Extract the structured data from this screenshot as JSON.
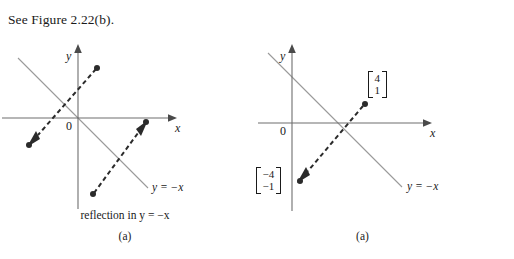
{
  "page": {
    "intro_text": "See Figure 2.22(b)."
  },
  "figures": [
    {
      "id": "figure-a-left",
      "caption_line1": "reflection in y = −x",
      "caption_line2": "(a)",
      "axes": {
        "x_label": "x",
        "y_label": "y",
        "origin_label": "0",
        "axis_color": "#6e6e6e"
      },
      "mirror_line": {
        "label": "y = −x",
        "color": "#9a9a9a",
        "equation": "y = -x"
      },
      "vectors": [
        {
          "name": "original-vector-arrow",
          "from": {
            "x": 98,
            "y": 68
          },
          "to": {
            "x": 30,
            "y": 145
          },
          "style": "dashed",
          "color": "#2b2b2b",
          "label": ""
        },
        {
          "name": "reflected-vector-arrow",
          "from": {
            "x": 92,
            "y": 193
          },
          "to": {
            "x": 145,
            "y": 122
          },
          "style": "dashed",
          "color": "#2b2b2b",
          "label": ""
        }
      ]
    },
    {
      "id": "figure-a-right",
      "caption_line1": "",
      "caption_line2": "(a)",
      "axes": {
        "x_label": "x",
        "y_label": "y",
        "origin_label": "0",
        "axis_color": "#6e6e6e"
      },
      "mirror_line": {
        "label": "y = −x",
        "color": "#9a9a9a",
        "equation": "y = -x"
      },
      "vectors": [
        {
          "name": "reflected-vector-arrow",
          "from": {
            "x": 365,
            "y": 104
          },
          "to": {
            "x": 300,
            "y": 180
          },
          "style": "dashed",
          "color": "#2b2b2b",
          "label": "[4,1]"
        }
      ],
      "vector_labels": [
        {
          "name": "vector-label-4-1",
          "top": "4",
          "bottom": "1"
        },
        {
          "name": "vector-label-neg4-neg1",
          "top": "−4",
          "bottom": "−1"
        }
      ]
    }
  ],
  "colors": {
    "ink": "#1a1a1a",
    "axis": "#6e6e6e",
    "mirror_line": "#9a9a9a",
    "vector": "#2b2b2b",
    "page_background": "#ffffff"
  }
}
